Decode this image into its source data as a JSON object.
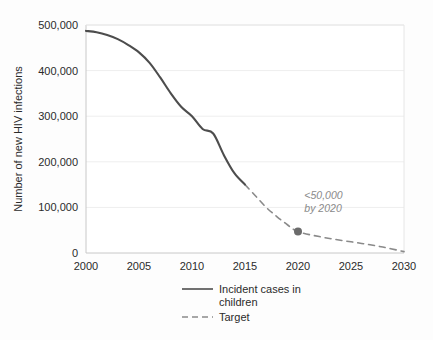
{
  "chart_data": {
    "type": "line",
    "title": "",
    "subtitle": "",
    "xlabel": "",
    "ylabel": "Number of new HIV infections",
    "xlim": [
      2000,
      2030
    ],
    "ylim": [
      0,
      500000
    ],
    "grid": true,
    "grid_axis": "y",
    "legend_position": "bottom-center",
    "x_ticks": [
      2000,
      2005,
      2010,
      2015,
      2020,
      2025,
      2030
    ],
    "x_tick_labels": [
      "2000",
      "2005",
      "2010",
      "2015",
      "2020",
      "2025",
      "2030"
    ],
    "y_ticks": [
      0,
      100000,
      200000,
      300000,
      400000,
      500000
    ],
    "y_tick_labels": [
      "0",
      "100,000",
      "200,000",
      "300,000",
      "400,000",
      "500,000"
    ],
    "series": [
      {
        "name": "Incident cases in children",
        "style": "solid",
        "color": "#4d4d4d",
        "x": [
          2000,
          2001,
          2002,
          2003,
          2004,
          2005,
          2006,
          2007,
          2008,
          2009,
          2010,
          2011,
          2012,
          2013,
          2014,
          2015
        ],
        "values": [
          487000,
          484000,
          478000,
          469000,
          456000,
          440000,
          417000,
          385000,
          350000,
          320000,
          300000,
          272000,
          262000,
          215000,
          175000,
          150000
        ]
      },
      {
        "name": "Target",
        "style": "dashed",
        "color": "#8a8a8a",
        "x": [
          2015,
          2016,
          2017,
          2018,
          2019,
          2020,
          2022,
          2024,
          2026,
          2028,
          2030
        ],
        "values": [
          150000,
          125000,
          100000,
          80000,
          62000,
          47000,
          36000,
          28000,
          21000,
          13000,
          3000
        ]
      }
    ],
    "markers": [
      {
        "name": "target-2020-point",
        "x": 2020,
        "y": 47000,
        "color": "#6b6b6b",
        "radius": 4
      }
    ],
    "annotations": [
      {
        "name": "target-2020-annotation",
        "line1": "<50,000",
        "line2": "by 2020",
        "x": 2020.6,
        "y": 118000,
        "color": "#8a8a8a"
      }
    ],
    "legend": [
      {
        "label_line1": "Incident cases in",
        "label_line2": "children",
        "style": "solid",
        "color": "#4d4d4d"
      },
      {
        "label_line1": "Target",
        "label_line2": "",
        "style": "dashed",
        "color": "#8a8a8a"
      }
    ],
    "colors": {
      "background": "#fdfdfd",
      "plot_background": "#ffffff",
      "gridline": "#eeeeee",
      "axis": "#c8c8c8",
      "text": "#2b2b2b",
      "muted_text": "#8a8a8a"
    }
  }
}
